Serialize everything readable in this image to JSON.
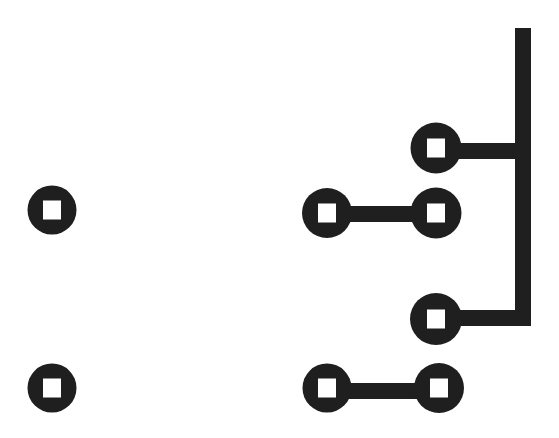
{
  "canvas": {
    "width": 559,
    "height": 438,
    "background_color": "#ffffff",
    "ink_color": "#1f1f1f"
  },
  "diagram": {
    "type": "node-link-tree",
    "title": "",
    "node_glyph": "square-in-circle",
    "node_style": {
      "outer_diameter": 50,
      "ring_thickness": 16,
      "inner_square_size": 18,
      "inner_square_color": "#ffffff"
    },
    "link_style": {
      "thickness": 16,
      "cap": "butt"
    },
    "nodes": [
      {
        "id": "n1",
        "label": "",
        "cx": 52,
        "cy": 210,
        "r": 24.5,
        "group": "isolated-left"
      },
      {
        "id": "n2",
        "label": "",
        "cx": 52,
        "cy": 388,
        "r": 24.5,
        "group": "isolated-left"
      },
      {
        "id": "n3",
        "label": "",
        "cx": 327,
        "cy": 213,
        "r": 25.0,
        "group": "pair-left"
      },
      {
        "id": "n4",
        "label": "",
        "cx": 327,
        "cy": 388,
        "r": 24.5,
        "group": "pair-left"
      },
      {
        "id": "n5",
        "label": "",
        "cx": 436,
        "cy": 148,
        "r": 25.5,
        "group": "branch-right"
      },
      {
        "id": "n6",
        "label": "",
        "cx": 436,
        "cy": 213,
        "r": 25.5,
        "group": "branch-right"
      },
      {
        "id": "n7",
        "label": "",
        "cx": 436,
        "cy": 319,
        "r": 26.0,
        "group": "branch-right"
      },
      {
        "id": "n8",
        "label": "",
        "cx": 439,
        "cy": 388,
        "r": 25.0,
        "group": "pair-right"
      }
    ],
    "edges": [
      {
        "id": "e1",
        "from": "n5",
        "to": "trunk-top",
        "kind": "horizontal",
        "x1": 436,
        "x2": 531,
        "y": 151
      },
      {
        "id": "e2",
        "from": "n3",
        "to": "n6",
        "kind": "horizontal",
        "x1": 327,
        "x2": 436,
        "y": 214
      },
      {
        "id": "e3",
        "from": "n7",
        "to": "trunk-bottom",
        "kind": "horizontal",
        "x1": 436,
        "x2": 531,
        "y": 318
      },
      {
        "id": "e4",
        "from": "n4",
        "to": "n8",
        "kind": "horizontal",
        "x1": 327,
        "x2": 439,
        "y": 391
      }
    ],
    "trunk": {
      "id": "trunk",
      "label": "",
      "kind": "vertical",
      "x": 523,
      "y1": 28,
      "y2": 326,
      "thickness": 16
    }
  }
}
